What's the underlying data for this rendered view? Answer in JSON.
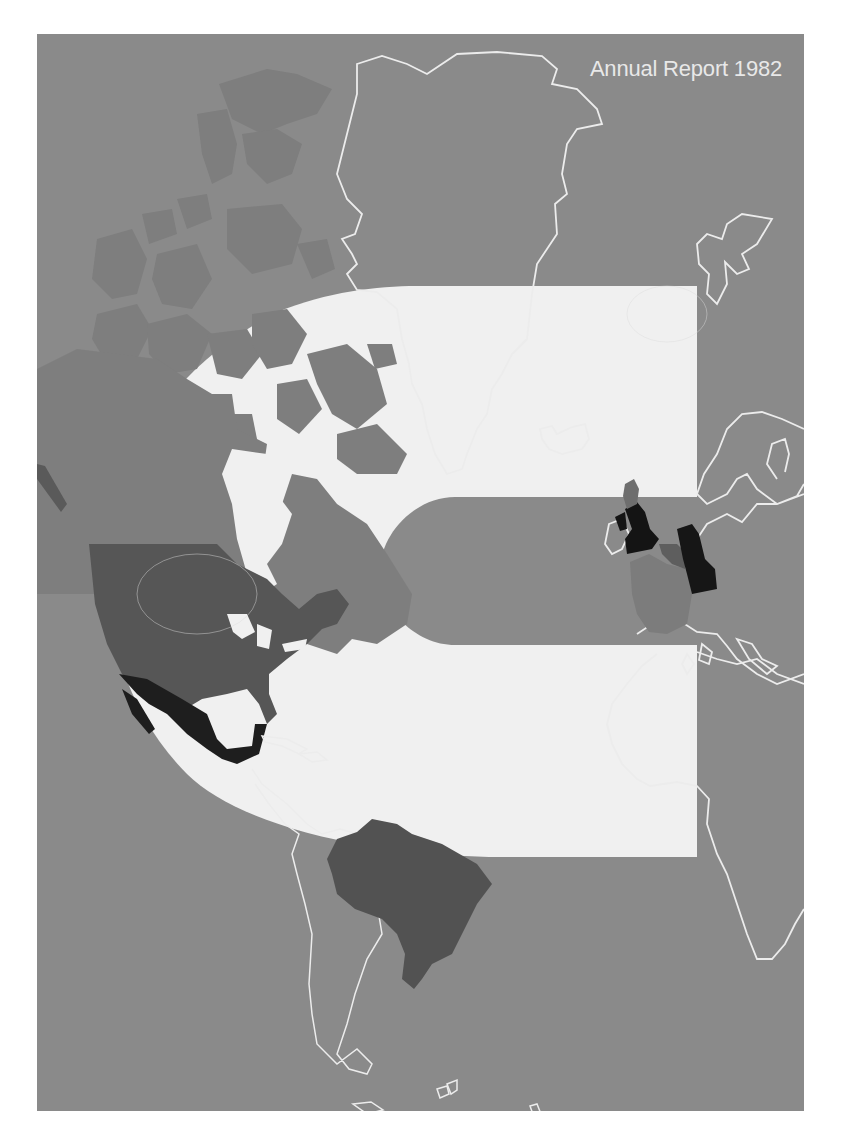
{
  "cover": {
    "title": "Annual Report 1982",
    "colors": {
      "background": "#8a8a8a",
      "logo_white": "#f0f0f0",
      "outline": "#ececec",
      "canada": "#7e7e7e",
      "usa": "#565656",
      "mexico": "#1e1e1e",
      "brazil": "#525252",
      "uk": "#141414",
      "germany": "#161616",
      "france": "#7c7c7c",
      "scotland": "#6e6e6e",
      "benelux": "#5e5e5e"
    }
  },
  "logo": {
    "description": "large white C-shaped logo overlaid on map"
  },
  "map": {
    "highlighted_regions": [
      "Canada",
      "United States",
      "Mexico",
      "Brazil",
      "United Kingdom",
      "West Germany",
      "France",
      "Belgium"
    ],
    "outlined_regions": [
      "Greenland",
      "Iceland",
      "Svalbard",
      "Scandinavia",
      "Europe",
      "Africa",
      "South America",
      "Caribbean"
    ]
  }
}
